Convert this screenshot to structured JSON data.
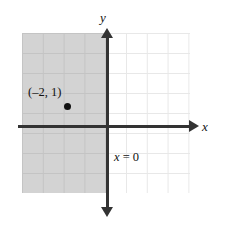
{
  "figure": {
    "type": "coordinate-plane-inequality-graph"
  },
  "axes": {
    "x_label": "x",
    "y_label": "y",
    "x_arrow": "right-arrow",
    "y_arrow_up": "up-arrow",
    "y_arrow_down": "down-arrow",
    "axis_color": "#333333"
  },
  "grid": {
    "cell_size": 20,
    "gridline_color": "#e8e8e8",
    "shaded_gridline_color": "#c4c4c4"
  },
  "shading": {
    "fill_color": "#d3d3d3",
    "region": "x < 0"
  },
  "point": {
    "label": "(–2, 1)",
    "x": -2,
    "y": 1,
    "dot_color": "#111111"
  },
  "boundary": {
    "equation_var": "x",
    "equation_rest": " = 0"
  },
  "chart_data": {
    "type": "scatter",
    "title": "",
    "xlabel": "x",
    "ylabel": "y",
    "xlim": [
      -4,
      4
    ],
    "ylim": [
      -3,
      5
    ],
    "grid": true,
    "legend": "none",
    "points": [
      {
        "x": -2,
        "y": 1,
        "label": "(–2, 1)"
      }
    ],
    "shaded_regions": [
      {
        "inequality": "x < 0",
        "boundary": "x = 0",
        "fill": "#d3d3d3"
      }
    ],
    "annotations": [
      {
        "text": "x = 0",
        "x": 0.4,
        "y": -1.6
      },
      {
        "text": "(–2, 1)",
        "x": -2.6,
        "y": 1.9
      }
    ]
  }
}
